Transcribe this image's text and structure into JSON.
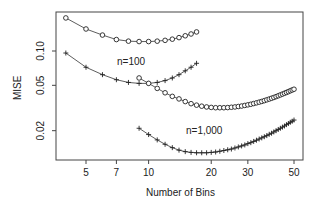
{
  "chart_data": {
    "type": "line",
    "title": "",
    "xlabel": "Number of Bins",
    "ylabel": "MISE",
    "xscale": "log",
    "yscale": "log",
    "xlim": [
      3.7,
      57
    ],
    "ylim": [
      0.0115,
      0.22
    ],
    "x_ticks": [
      5,
      7,
      10,
      20,
      30,
      50
    ],
    "x_tick_labels": [
      "5",
      "7",
      "10",
      "20",
      "30",
      "50"
    ],
    "y_ticks": [
      0.02,
      0.05,
      0.1
    ],
    "y_tick_labels": [
      "0.02",
      "0.05",
      "0.10"
    ],
    "grid": false,
    "legend": null,
    "annotations": [
      {
        "text": "n=100",
        "x": 9.5,
        "y": 0.072
      },
      {
        "text": "n=1,000",
        "x": 22,
        "y": 0.0205
      }
    ],
    "series": [
      {
        "name": "n=100 (o)",
        "marker": "o",
        "x": [
          4,
          5,
          6,
          7,
          8,
          9,
          10,
          11,
          12,
          13,
          14,
          15,
          16,
          17
        ],
        "values": [
          0.195,
          0.156,
          0.138,
          0.126,
          0.122,
          0.121,
          0.121,
          0.122,
          0.124,
          0.127,
          0.131,
          0.136,
          0.141,
          0.147
        ]
      },
      {
        "name": "n=100 (+)",
        "marker": "+",
        "x": [
          4,
          5,
          6,
          7,
          8,
          9,
          10,
          11,
          12,
          13,
          14,
          15,
          16,
          17
        ],
        "values": [
          0.096,
          0.072,
          0.062,
          0.056,
          0.053,
          0.052,
          0.052,
          0.053,
          0.055,
          0.058,
          0.062,
          0.067,
          0.072,
          0.078
        ]
      },
      {
        "name": "n=1,000 (o)",
        "marker": "o",
        "x": [
          9,
          10,
          11,
          12,
          13,
          14,
          15,
          16,
          17,
          18,
          19,
          20,
          21,
          22,
          23,
          24,
          25,
          26,
          27,
          28,
          29,
          30,
          31,
          32,
          33,
          34,
          35,
          36,
          37,
          38,
          39,
          40,
          41,
          42,
          43,
          44,
          45,
          46,
          47,
          48,
          49,
          50
        ],
        "values": [
          0.058,
          0.052,
          0.047,
          0.043,
          0.04,
          0.038,
          0.036,
          0.0345,
          0.0335,
          0.0328,
          0.0323,
          0.032,
          0.0318,
          0.0318,
          0.0318,
          0.0319,
          0.0321,
          0.0323,
          0.0326,
          0.0329,
          0.0333,
          0.0337,
          0.0341,
          0.0346,
          0.0351,
          0.0356,
          0.0361,
          0.0367,
          0.0373,
          0.0379,
          0.0385,
          0.0391,
          0.0398,
          0.0405,
          0.0412,
          0.0419,
          0.0426,
          0.0433,
          0.044,
          0.0448,
          0.0455,
          0.0462
        ]
      },
      {
        "name": "n=1,000 (+)",
        "marker": "+",
        "x": [
          9,
          10,
          11,
          12,
          13,
          14,
          15,
          16,
          17,
          18,
          19,
          20,
          21,
          22,
          23,
          24,
          25,
          26,
          27,
          28,
          29,
          30,
          31,
          32,
          33,
          34,
          35,
          36,
          37,
          38,
          39,
          40,
          41,
          42,
          43,
          44,
          45,
          46,
          47,
          48,
          49,
          50
        ],
        "values": [
          0.021,
          0.0185,
          0.0166,
          0.0152,
          0.0142,
          0.0135,
          0.0131,
          0.0129,
          0.0128,
          0.0128,
          0.0128,
          0.0129,
          0.013,
          0.0132,
          0.0134,
          0.0136,
          0.0138,
          0.0141,
          0.0144,
          0.0147,
          0.015,
          0.0154,
          0.0157,
          0.0161,
          0.0165,
          0.0169,
          0.0173,
          0.0177,
          0.0181,
          0.0186,
          0.019,
          0.0195,
          0.02,
          0.0205,
          0.021,
          0.0215,
          0.022,
          0.0226,
          0.0231,
          0.0237,
          0.0242,
          0.0248
        ]
      }
    ]
  },
  "axes": {
    "xlabel": "Number of Bins",
    "ylabel": "MISE"
  },
  "annotations": {
    "n100": "n=100",
    "n1000": "n=1,000"
  },
  "style": {
    "line_color": "#333333",
    "marker_color": "#222222",
    "axis_color": "#444444",
    "background": "#ffffff"
  }
}
